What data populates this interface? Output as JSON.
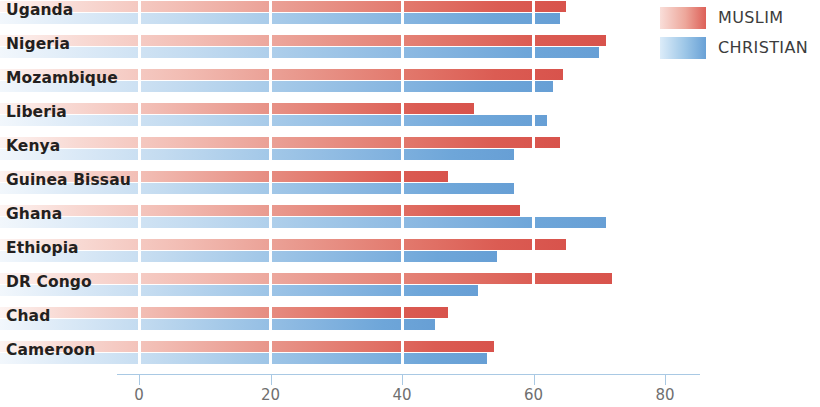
{
  "chart_data": {
    "type": "bar",
    "orientation": "horizontal",
    "title": "",
    "subtitle": "",
    "xlabel": "",
    "ylabel": "",
    "xlim": [
      0,
      88
    ],
    "xticks": [
      0,
      20,
      40,
      60,
      80
    ],
    "xtick_labels": [
      "0",
      "20",
      "40",
      "60",
      "80"
    ],
    "grid": true,
    "grid_axis": "x",
    "grid_color": "#ffffff",
    "legend_position": "top-right",
    "categories": [
      "Uganda",
      "Nigeria",
      "Mozambique",
      "Liberia",
      "Kenya",
      "Guinea Bissau",
      "Ghana",
      "Ethiopia",
      "DR Congo",
      "Chad",
      "Cameroon"
    ],
    "series": [
      {
        "name": "MUSLIM",
        "color": "#d8534c",
        "values": [
          65,
          71,
          64.5,
          51,
          64,
          47,
          58,
          65,
          72,
          47,
          54
        ]
      },
      {
        "name": "CHRISTIAN",
        "color": "#679fd5",
        "values": [
          64,
          70,
          63,
          62,
          57,
          57,
          71,
          54.5,
          51.5,
          45,
          53
        ]
      }
    ]
  },
  "legend": {
    "items": [
      {
        "label": "MUSLIM",
        "color": "#d8534c"
      },
      {
        "label": "CHRISTIAN",
        "color": "#679fd5"
      }
    ]
  },
  "axis": {
    "ticks": [
      {
        "label": "0",
        "value": 0
      },
      {
        "label": "20",
        "value": 20
      },
      {
        "label": "40",
        "value": 40
      },
      {
        "label": "60",
        "value": 60
      },
      {
        "label": "80",
        "value": 80
      }
    ]
  }
}
